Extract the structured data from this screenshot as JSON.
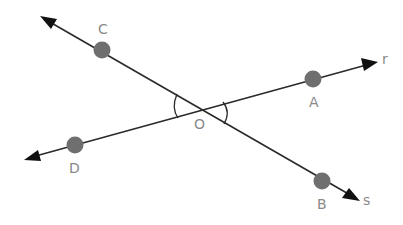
{
  "diagram": {
    "type": "intersecting-lines",
    "colors": {
      "line": "#2a2a2a",
      "point": "#6f6f6f",
      "label": "#8a8a8a",
      "arrowhead": "#111111"
    },
    "lines": [
      {
        "name": "s",
        "label": "s",
        "through": [
          "C",
          "O",
          "B"
        ]
      },
      {
        "name": "r",
        "label": "r",
        "through": [
          "D",
          "O",
          "A"
        ]
      }
    ],
    "points": [
      {
        "id": "C",
        "label": "C"
      },
      {
        "id": "A",
        "label": "A"
      },
      {
        "id": "O",
        "label": "O"
      },
      {
        "id": "D",
        "label": "D"
      },
      {
        "id": "B",
        "label": "B"
      }
    ],
    "marked_angles": [
      "COD",
      "AOB"
    ]
  }
}
